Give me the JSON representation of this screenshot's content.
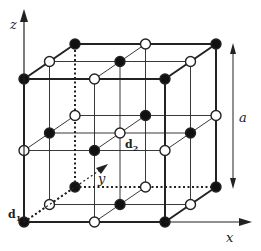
{
  "diagram": {
    "axes": {
      "x_label": "x",
      "y_label": "y",
      "z_label": "z"
    },
    "lattice_constant_label": "a",
    "basis_labels": {
      "d1": {
        "main": "d",
        "sub": "1"
      },
      "d2": {
        "main": "d",
        "sub": "2"
      }
    },
    "colors": {
      "filled_atom": "#111111",
      "open_atom": "#ffffff",
      "line": "#222222"
    },
    "atom_types": [
      {
        "name": "filled",
        "description": "sublattice d1 (corners & face centers)"
      },
      {
        "name": "open",
        "description": "sublattice d2 (edge midpoints & body center)"
      }
    ]
  }
}
